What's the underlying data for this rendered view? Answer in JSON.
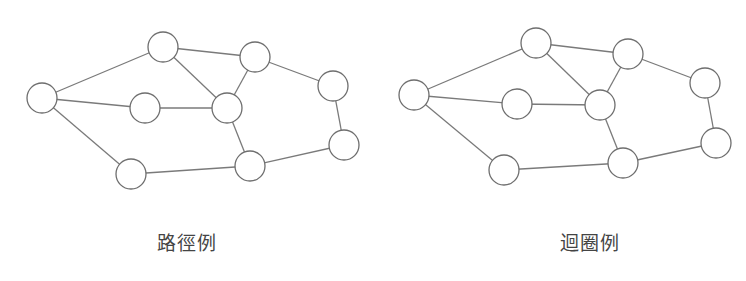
{
  "figures": [
    {
      "id": "path",
      "caption": "路徑例",
      "caption_x": 187,
      "nodes": [
        {
          "id": "A",
          "x": 42,
          "y": 98,
          "r": 15
        },
        {
          "id": "B",
          "x": 163,
          "y": 47,
          "r": 15
        },
        {
          "id": "C",
          "x": 255,
          "y": 57,
          "r": 15
        },
        {
          "id": "D",
          "x": 333,
          "y": 86,
          "r": 15
        },
        {
          "id": "E",
          "x": 145,
          "y": 108,
          "r": 15
        },
        {
          "id": "F",
          "x": 227,
          "y": 108,
          "r": 15
        },
        {
          "id": "G",
          "x": 344,
          "y": 145,
          "r": 15
        },
        {
          "id": "H",
          "x": 250,
          "y": 166,
          "r": 15
        },
        {
          "id": "I",
          "x": 131,
          "y": 174,
          "r": 15
        }
      ]
    },
    {
      "id": "cycle",
      "caption": "迴圈例",
      "caption_x": 590,
      "nodes": [
        {
          "id": "A",
          "x": 414,
          "y": 95,
          "r": 15
        },
        {
          "id": "B",
          "x": 536,
          "y": 43,
          "r": 15
        },
        {
          "id": "C",
          "x": 628,
          "y": 54,
          "r": 15
        },
        {
          "id": "D",
          "x": 705,
          "y": 83,
          "r": 15
        },
        {
          "id": "E",
          "x": 517,
          "y": 104,
          "r": 15
        },
        {
          "id": "F",
          "x": 600,
          "y": 105,
          "r": 15
        },
        {
          "id": "G",
          "x": 716,
          "y": 143,
          "r": 15
        },
        {
          "id": "H",
          "x": 623,
          "y": 163,
          "r": 15
        },
        {
          "id": "I",
          "x": 504,
          "y": 170,
          "r": 15
        }
      ]
    }
  ],
  "edges": [
    [
      "A",
      "B"
    ],
    [
      "A",
      "E"
    ],
    [
      "A",
      "I"
    ],
    [
      "B",
      "C"
    ],
    [
      "B",
      "F"
    ],
    [
      "C",
      "F"
    ],
    [
      "C",
      "D"
    ],
    [
      "E",
      "F"
    ],
    [
      "F",
      "H"
    ],
    [
      "D",
      "G"
    ],
    [
      "G",
      "H"
    ],
    [
      "I",
      "H"
    ]
  ],
  "colors": {
    "edge": "#7a7a7a",
    "node_stroke": "#6e6e6e",
    "node_fill": "#ffffff",
    "caption": "#444444"
  }
}
